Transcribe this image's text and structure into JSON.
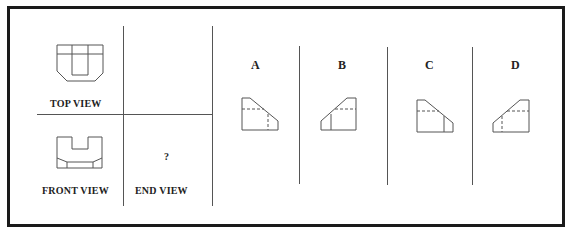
{
  "question_views": {
    "top_view": {
      "label": "TOP VIEW"
    },
    "front_view": {
      "label": "FRONT VIEW"
    },
    "end_view": {
      "label": "END VIEW",
      "placeholder": "?"
    }
  },
  "options": [
    {
      "label": "A"
    },
    {
      "label": "B"
    },
    {
      "label": "C"
    },
    {
      "label": "D"
    }
  ],
  "colors": {
    "line": "#555555",
    "frame": "#1a1a1a",
    "text": "#222222"
  }
}
